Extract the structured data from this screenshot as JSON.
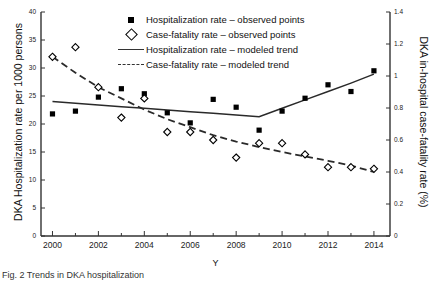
{
  "chart_data": {
    "type": "scatter",
    "title": "",
    "xlabel": "Y",
    "ylabel": "DKA Hospitalization rate per 1000 persons",
    "y2label": "DKA in-hospital case-fatality rate (%)",
    "x": [
      2000,
      2001,
      2002,
      2003,
      2004,
      2005,
      2006,
      2007,
      2008,
      2009,
      2010,
      2011,
      2012,
      2013,
      2014
    ],
    "xlim": [
      1999.5,
      2014.7
    ],
    "ylim": [
      0,
      40
    ],
    "y2lim": [
      0,
      1.4
    ],
    "xticks": [
      "2000",
      "2002",
      "2004",
      "2006",
      "2008",
      "2010",
      "2012",
      "2014"
    ],
    "xtick_values": [
      2000,
      2002,
      2004,
      2006,
      2008,
      2010,
      2012,
      2014
    ],
    "yticks": [
      "0",
      "5",
      "10",
      "15",
      "20",
      "25",
      "30",
      "35",
      "40"
    ],
    "ytick_values": [
      0,
      5,
      10,
      15,
      20,
      25,
      30,
      35,
      40
    ],
    "y2ticks": [
      "0",
      "0.2",
      "0.4",
      "0.6",
      "0.8",
      "1",
      "1.2",
      "1.4"
    ],
    "y2tick_values": [
      0,
      0.2,
      0.4,
      0.6,
      0.8,
      1.0,
      1.2,
      1.4
    ],
    "grid": false,
    "legend_position": "top-center",
    "series": [
      {
        "name": "Hospitalization rate – observed points",
        "axis": "left",
        "marker": "filled-square",
        "values": [
          21.8,
          22.3,
          24.8,
          26.3,
          25.4,
          22.0,
          20.2,
          24.4,
          23.0,
          18.9,
          22.3,
          24.6,
          27.0,
          25.8,
          29.5
        ]
      },
      {
        "name": "Case-fatality rate – observed points",
        "axis": "right",
        "marker": "open-diamond",
        "values": [
          1.12,
          1.18,
          0.93,
          0.74,
          0.86,
          0.65,
          0.65,
          0.6,
          0.49,
          0.58,
          0.58,
          0.51,
          0.43,
          0.43,
          0.42
        ]
      },
      {
        "name": "Hospitalization rate – modeled trend",
        "axis": "left",
        "line": "solid",
        "values": [
          24.0,
          23.7,
          23.4,
          23.1,
          22.8,
          22.5,
          22.2,
          21.9,
          21.6,
          21.3,
          22.8,
          24.3,
          25.8,
          27.3,
          28.9
        ]
      },
      {
        "name": "Case-fatality rate – modeled trend",
        "axis": "right",
        "line": "dashed",
        "values": [
          1.12,
          1.02,
          0.93,
          0.86,
          0.79,
          0.73,
          0.68,
          0.63,
          0.59,
          0.556,
          0.525,
          0.497,
          0.47,
          0.44,
          0.4
        ]
      }
    ]
  },
  "legend": {
    "items": [
      {
        "key": "filled-square",
        "label": "Hospitalization rate – observed points"
      },
      {
        "key": "open-diamond",
        "label": "Case-fatality rate – observed points"
      },
      {
        "key": "solid-line",
        "label": "Hospitalization rate – modeled trend"
      },
      {
        "key": "dashed-line",
        "label": "Case-fatality rate – modeled trend"
      }
    ]
  },
  "caption": {
    "text": "Fig. 2 Trends in DKA hospitalization"
  }
}
